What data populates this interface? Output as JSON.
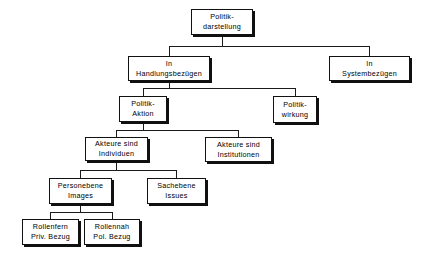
{
  "diagram": {
    "type": "tree",
    "style": {
      "background": "#ffffff",
      "box_fill": "#ffffff",
      "box_border": "#111111",
      "shadow": "#101010",
      "line": "#1a1a1a"
    },
    "nodes": [
      {
        "id": "politik-darstellung",
        "line1": "Politik-",
        "line2": "darstellung",
        "x": 191,
        "y": 9,
        "w": 62,
        "h": 26,
        "level": 0
      },
      {
        "id": "in-handlungsbezuegen",
        "line1": "In",
        "line2": "Handlungsbezügen",
        "x": 128,
        "y": 56,
        "w": 82,
        "h": 25,
        "level": 1
      },
      {
        "id": "in-systembezuegen",
        "line1": "In",
        "line2": "Systembezügen",
        "x": 329,
        "y": 56,
        "w": 81,
        "h": 25,
        "level": 1
      },
      {
        "id": "politik-aktion",
        "line1": "Politik-",
        "line2": "Aktion",
        "x": 119,
        "y": 96,
        "w": 48,
        "h": 26,
        "level": 2
      },
      {
        "id": "politik-wirkung",
        "line1": "Politik-",
        "line2": "wirkung",
        "x": 273,
        "y": 96,
        "w": 44,
        "h": 27,
        "level": 2
      },
      {
        "id": "akteure-sind-individuen",
        "line1": "Akteure sind",
        "line2": "Individuen",
        "x": 85,
        "y": 137,
        "w": 63,
        "h": 24,
        "level": 3
      },
      {
        "id": "akteure-sind-institutionen",
        "line1": "Akteure sind",
        "line2": "Institutionen",
        "x": 205,
        "y": 137,
        "w": 67,
        "h": 25,
        "level": 3
      },
      {
        "id": "personebene-images",
        "line1": "Personebene",
        "line2": "Images",
        "x": 49,
        "y": 178,
        "w": 63,
        "h": 26,
        "level": 4
      },
      {
        "id": "sachebene-issues",
        "line1": "Sachebene",
        "line2": "Issues",
        "x": 147,
        "y": 178,
        "w": 59,
        "h": 26,
        "level": 4
      },
      {
        "id": "rollenfern-priv-bezug",
        "line1": "Rollenfern",
        "line2": "Priv. Bezug",
        "x": 22,
        "y": 219,
        "w": 57,
        "h": 26,
        "level": 5
      },
      {
        "id": "rollennah-pol-bezug",
        "line1": "Rollennah",
        "line2": "Pol. Bezug",
        "x": 84,
        "y": 219,
        "w": 56,
        "h": 26,
        "level": 5
      }
    ],
    "edges": [
      {
        "from": "politik-darstellung",
        "to": "in-handlungsbezuegen"
      },
      {
        "from": "politik-darstellung",
        "to": "in-systembezuegen"
      },
      {
        "from": "in-handlungsbezuegen",
        "to": "politik-aktion"
      },
      {
        "from": "in-handlungsbezuegen",
        "to": "politik-wirkung"
      },
      {
        "from": "politik-aktion",
        "to": "akteure-sind-individuen"
      },
      {
        "from": "politik-aktion",
        "to": "akteure-sind-institutionen"
      },
      {
        "from": "akteure-sind-individuen",
        "to": "personebene-images"
      },
      {
        "from": "akteure-sind-individuen",
        "to": "sachebene-issues"
      },
      {
        "from": "personebene-images",
        "to": "rollenfern-priv-bezug"
      },
      {
        "from": "personebene-images",
        "to": "rollennah-pol-bezug"
      }
    ],
    "connector_segments": [
      {
        "name": "root-drop",
        "x1": 222,
        "y1": 35,
        "x2": 222,
        "y2": 46
      },
      {
        "name": "root-bar",
        "x1": 169,
        "y1": 46,
        "x2": 369,
        "y2": 46
      },
      {
        "name": "root-to-handl",
        "x1": 169,
        "y1": 46,
        "x2": 169,
        "y2": 56
      },
      {
        "name": "root-to-syst",
        "x1": 369,
        "y1": 46,
        "x2": 369,
        "y2": 56
      },
      {
        "name": "handl-drop",
        "x1": 169,
        "y1": 81,
        "x2": 169,
        "y2": 88
      },
      {
        "name": "handl-bar",
        "x1": 143,
        "y1": 88,
        "x2": 295,
        "y2": 88
      },
      {
        "name": "handl-to-aktion",
        "x1": 143,
        "y1": 88,
        "x2": 143,
        "y2": 96
      },
      {
        "name": "handl-to-wirkung",
        "x1": 295,
        "y1": 88,
        "x2": 295,
        "y2": 96
      },
      {
        "name": "aktion-drop",
        "x1": 143,
        "y1": 122,
        "x2": 143,
        "y2": 130
      },
      {
        "name": "aktion-bar",
        "x1": 116,
        "y1": 130,
        "x2": 238,
        "y2": 130
      },
      {
        "name": "aktion-to-indiv",
        "x1": 116,
        "y1": 130,
        "x2": 116,
        "y2": 137
      },
      {
        "name": "aktion-to-instit",
        "x1": 238,
        "y1": 130,
        "x2": 238,
        "y2": 137
      },
      {
        "name": "indiv-drop",
        "x1": 116,
        "y1": 161,
        "x2": 116,
        "y2": 170
      },
      {
        "name": "indiv-bar",
        "x1": 80,
        "y1": 170,
        "x2": 176,
        "y2": 170
      },
      {
        "name": "indiv-to-person",
        "x1": 80,
        "y1": 170,
        "x2": 80,
        "y2": 178
      },
      {
        "name": "indiv-to-sach",
        "x1": 176,
        "y1": 170,
        "x2": 176,
        "y2": 178
      },
      {
        "name": "person-drop",
        "x1": 80,
        "y1": 204,
        "x2": 80,
        "y2": 212
      },
      {
        "name": "person-bar",
        "x1": 50,
        "y1": 212,
        "x2": 112,
        "y2": 212
      },
      {
        "name": "person-to-fern",
        "x1": 50,
        "y1": 212,
        "x2": 50,
        "y2": 219
      },
      {
        "name": "person-to-nah",
        "x1": 112,
        "y1": 212,
        "x2": 112,
        "y2": 219
      }
    ]
  }
}
